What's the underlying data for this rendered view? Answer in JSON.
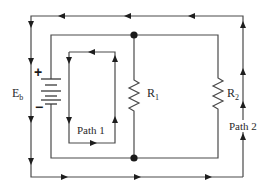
{
  "diagram": {
    "source_label": {
      "main": "E",
      "sub": "b"
    },
    "battery": {
      "positive_sign": "+",
      "negative_sign": "−"
    },
    "resistors": [
      {
        "main": "R",
        "sub": "1"
      },
      {
        "main": "R",
        "sub": "2"
      }
    ],
    "paths": [
      {
        "label": "Path 1"
      },
      {
        "label": "Path 2"
      }
    ],
    "colors": {
      "wire": "#4a4a4a",
      "arrow": "#1e1e1e",
      "junction": "#1a1a1a",
      "background": "#ffffff"
    }
  }
}
